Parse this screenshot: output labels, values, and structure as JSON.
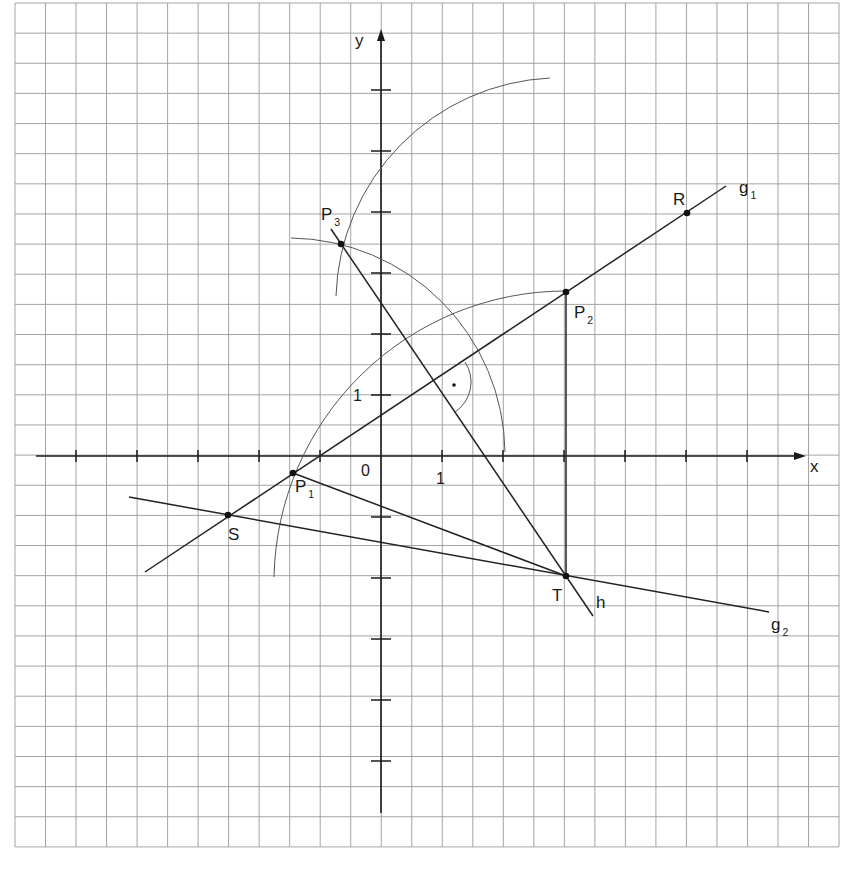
{
  "figure": {
    "type": "coordinate geometry construction",
    "canvas": {
      "width": 853,
      "height": 871
    },
    "grid": {
      "left": 15,
      "top": 3,
      "cols": 27,
      "rows": 28,
      "cell_w": 30.52,
      "cell_h": 30.14,
      "color": "#9a9a9a"
    },
    "origin_px": [
      381,
      456
    ],
    "unit_px": 61,
    "axes": {
      "x": {
        "label": "x",
        "from_px": 36,
        "to_px": 806,
        "label_pos": [
          810,
          472
        ]
      },
      "y": {
        "label": "y",
        "from_px": 813,
        "to_px": 29,
        "label_pos": [
          355,
          46
        ]
      },
      "x_ticks": [
        -5,
        -4,
        -3,
        -2,
        -1,
        1,
        2,
        3,
        4,
        5,
        6
      ],
      "y_ticks": [
        -5,
        -4,
        -3,
        -2,
        -1,
        1,
        2,
        3,
        4,
        5,
        6
      ],
      "tick_labels": [
        {
          "text": "0",
          "pos": [
            361,
            476
          ]
        },
        {
          "text": "1",
          "pos": [
            436,
            484
          ]
        },
        {
          "text": "1",
          "pos": [
            353,
            401
          ]
        }
      ]
    },
    "points": [
      {
        "name": "S",
        "sub": "",
        "coords": [
          -2.5,
          -1
        ],
        "px": [
          228,
          515
        ],
        "label_pos": [
          228,
          540
        ]
      },
      {
        "name": "P",
        "sub": "1",
        "coords": [
          -1.44,
          -0.28
        ],
        "px": [
          293,
          473
        ],
        "label_pos": [
          295,
          492
        ]
      },
      {
        "name": "R",
        "sub": "",
        "coords": [
          5,
          4
        ],
        "px": [
          687,
          213
        ],
        "label_pos": [
          673,
          205
        ]
      },
      {
        "name": "P",
        "sub": "2",
        "coords": [
          3,
          2.67
        ],
        "px": [
          566,
          292
        ],
        "label_pos": [
          574,
          318
        ]
      },
      {
        "name": "T",
        "sub": "",
        "coords": [
          3,
          -2
        ],
        "px": [
          566,
          576
        ],
        "label_pos": [
          552,
          601
        ]
      },
      {
        "name": "P",
        "sub": "3",
        "coords": [
          -0.66,
          3.5
        ],
        "px": [
          341,
          244
        ],
        "label_pos": [
          321,
          220
        ]
      }
    ],
    "lines": [
      {
        "name": "g",
        "sub": "1",
        "from": [
          145,
          572
        ],
        "to": [
          726,
          186
        ],
        "label_pos": [
          739,
          193
        ]
      },
      {
        "name": "g",
        "sub": "2",
        "from": [
          129,
          497
        ],
        "to": [
          769,
          612
        ],
        "label_pos": [
          771,
          630
        ]
      },
      {
        "name": "h",
        "sub": "",
        "from": [
          331,
          229
        ],
        "to": [
          593,
          616
        ],
        "label_pos": [
          596,
          608
        ]
      }
    ],
    "segments": [
      {
        "name": "P1T",
        "from": [
          293,
          473
        ],
        "to": [
          566,
          576
        ]
      },
      {
        "name": "P2T",
        "from": [
          566,
          292
        ],
        "to": [
          566,
          576
        ]
      }
    ],
    "arcs": [
      {
        "name": "arc-center-T",
        "from": [
          274,
          577
        ],
        "to": [
          566,
          291
        ],
        "r": 292
      },
      {
        "name": "arc-center-P2",
        "from": [
          336,
          296
        ],
        "to": [
          550,
          78
        ],
        "r": 225
      },
      {
        "name": "arc-center-P1",
        "from": [
          291,
          238
        ],
        "to": [
          505,
          452
        ],
        "r": 217
      }
    ],
    "right_angle": {
      "vertex": [
        433,
        380
      ],
      "from": [
        465,
        362
      ],
      "to": [
        455,
        412
      ],
      "r": 36,
      "dot": [
        454,
        385
      ]
    }
  }
}
